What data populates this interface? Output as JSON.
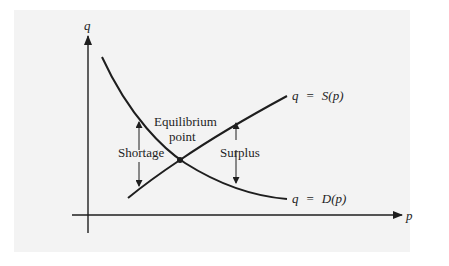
{
  "figure": {
    "background_color": "#f3f3f3",
    "line_color": "#1e1e1e",
    "axes": {
      "x_label": "p",
      "y_label": "q"
    },
    "curves": {
      "supply": {
        "var": "q",
        "eq": "=",
        "func": "S(p)",
        "label": "q = S(p)"
      },
      "demand": {
        "var": "q",
        "eq": "=",
        "func": "D(p)",
        "label": "q = D(p)"
      }
    },
    "annotations": {
      "equilibrium_line1": "Equilibrium",
      "equilibrium_line2": "point",
      "shortage": "Shortage",
      "surplus": "Surplus"
    }
  }
}
